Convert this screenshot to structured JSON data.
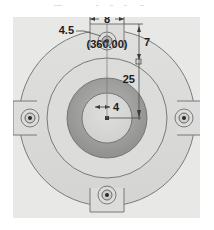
{
  "drawing": {
    "title": "flange-plate-front-view",
    "view_type": "front view",
    "background_color": "#e8e8e6",
    "line_color": "#6e6e6e",
    "text_color": "#1d1d1d",
    "hub_ring_color": "#9a9a9a",
    "bore_color": "#d5d5d3",
    "plate_color": "#dcdcda"
  },
  "dimensions": {
    "lug_width": "8",
    "bolt_hole_dia": "4.5",
    "bolt_circle_note": "(360.00)",
    "edge_distance": "7",
    "bolt_circle_radius": "25",
    "bore_dia": "4"
  },
  "geometry": {
    "center_x": 107,
    "center_y": 118,
    "outer_circle_r": 88,
    "mid_circle_r": 60,
    "hub_outer_r": 40,
    "bore_r": 25,
    "bolt_circle_r": 56,
    "lug_half_width": 17,
    "lug_depth": 24,
    "bolt_hole_outer_r": 9,
    "bolt_hole_inner_r": 5,
    "bolt_hole_dot_r": 2
  },
  "labels": {
    "top_lug": "top-lug",
    "left_lug": "left-lug",
    "right_lug": "right-lug",
    "bottom_lug": "bottom-lug"
  }
}
